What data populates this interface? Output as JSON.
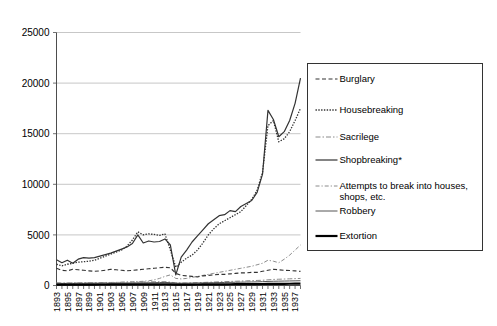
{
  "chart_data": {
    "type": "line",
    "title": "",
    "xlabel": "",
    "ylabel": "",
    "ylim": [
      0,
      25000
    ],
    "xlim": [
      1893,
      1938
    ],
    "grid": true,
    "legend_position": "right",
    "y_ticks": [
      0,
      5000,
      10000,
      15000,
      20000,
      25000
    ],
    "y_tick_labels": [
      "0",
      "5000",
      "10000",
      "15000",
      "20000",
      "25000"
    ],
    "x_tick_labels": [
      "1893",
      "1895",
      "1897",
      "1899",
      "1901",
      "1903",
      "1905",
      "1907",
      "1909",
      "1911",
      "1913",
      "1915",
      "1917",
      "1919",
      "1921",
      "1923",
      "1925",
      "1927",
      "1929",
      "1931",
      "1933",
      "1935",
      "1937"
    ],
    "x_all_years": [
      1893,
      1894,
      1895,
      1896,
      1897,
      1898,
      1899,
      1900,
      1901,
      1902,
      1903,
      1904,
      1905,
      1906,
      1907,
      1908,
      1909,
      1910,
      1911,
      1912,
      1913,
      1914,
      1915,
      1916,
      1917,
      1918,
      1919,
      1920,
      1921,
      1922,
      1923,
      1924,
      1925,
      1926,
      1927,
      1928,
      1929,
      1930,
      1931,
      1932,
      1933,
      1934,
      1935,
      1936,
      1937,
      1938
    ],
    "series": [
      {
        "name": "Burglary",
        "style": "dashed",
        "color": "#333333",
        "width": 1.1,
        "dasharray": "4,2.5",
        "values": [
          1700,
          1500,
          1450,
          1600,
          1550,
          1500,
          1450,
          1400,
          1450,
          1500,
          1600,
          1550,
          1500,
          1450,
          1500,
          1550,
          1600,
          1650,
          1700,
          1750,
          1800,
          1750,
          1200,
          1000,
          950,
          900,
          850,
          950,
          1000,
          1050,
          1100,
          1100,
          1150,
          1200,
          1250,
          1250,
          1300,
          1300,
          1400,
          1500,
          1600,
          1550,
          1500,
          1480,
          1450,
          1400
        ]
      },
      {
        "name": "Housebreaking",
        "style": "dotted",
        "color": "#333333",
        "width": 1.3,
        "dasharray": "1.4,1.4",
        "values": [
          2100,
          1950,
          2100,
          2200,
          2300,
          2350,
          2400,
          2500,
          2700,
          2900,
          3100,
          3300,
          3500,
          3900,
          4500,
          5300,
          5000,
          5100,
          5050,
          4950,
          5100,
          3500,
          1800,
          2300,
          2700,
          3000,
          3500,
          4200,
          5000,
          5600,
          6100,
          6400,
          6700,
          7000,
          7300,
          7900,
          8500,
          9400,
          11200,
          15800,
          16300,
          14200,
          14500,
          15200,
          16300,
          17500
        ]
      },
      {
        "name": "Sacrilege",
        "style": "dashdot-light",
        "color": "#8a8a8a",
        "width": 1.0,
        "dasharray": "5,2,1.5,2",
        "values": [
          260,
          250,
          250,
          260,
          270,
          270,
          280,
          280,
          290,
          300,
          300,
          310,
          320,
          330,
          340,
          350,
          360,
          360,
          370,
          370,
          380,
          330,
          260,
          250,
          250,
          260,
          280,
          300,
          320,
          340,
          360,
          380,
          400,
          420,
          440,
          460,
          480,
          500,
          520,
          560,
          600,
          620,
          640,
          660,
          680,
          700
        ]
      },
      {
        "name": "Shopbreaking*",
        "style": "solid",
        "color": "#333333",
        "width": 1.2,
        "dasharray": "",
        "values": [
          2550,
          2250,
          2500,
          2200,
          2600,
          2750,
          2700,
          2750,
          2900,
          3050,
          3200,
          3400,
          3600,
          3800,
          4150,
          5000,
          4200,
          4400,
          4300,
          4350,
          4600,
          4000,
          1050,
          2800,
          3500,
          4300,
          4900,
          5500,
          6100,
          6500,
          6900,
          7000,
          7400,
          7300,
          7800,
          8100,
          8400,
          9200,
          11000,
          17300,
          16400,
          14700,
          15200,
          16300,
          18000,
          20500
        ]
      },
      {
        "name": "Attempts to break into houses, shops, etc.",
        "style": "dashdot-light2",
        "color": "#8a8a8a",
        "width": 1.0,
        "dasharray": "4,2,1.2,2",
        "values": [
          230,
          225,
          230,
          235,
          240,
          245,
          250,
          255,
          265,
          280,
          290,
          300,
          320,
          340,
          360,
          380,
          420,
          460,
          560,
          700,
          900,
          1050,
          700,
          650,
          700,
          800,
          900,
          1000,
          1100,
          1200,
          1300,
          1400,
          1500,
          1600,
          1700,
          1800,
          1900,
          2050,
          2200,
          2500,
          2400,
          2250,
          2600,
          3000,
          3500,
          4000
        ]
      },
      {
        "name": "Robbery",
        "style": "solid-light",
        "color": "#555555",
        "width": 1.0,
        "dasharray": "",
        "values": [
          210,
          200,
          205,
          210,
          215,
          215,
          220,
          220,
          225,
          230,
          235,
          240,
          245,
          250,
          255,
          260,
          265,
          270,
          280,
          290,
          300,
          280,
          230,
          225,
          230,
          240,
          250,
          260,
          270,
          280,
          290,
          300,
          310,
          320,
          330,
          340,
          350,
          360,
          380,
          400,
          420,
          430,
          440,
          450,
          460,
          470
        ]
      },
      {
        "name": "Extortion",
        "style": "solid-thick",
        "color": "#000000",
        "width": 2.2,
        "dasharray": "",
        "values": [
          90,
          88,
          90,
          92,
          94,
          94,
          96,
          96,
          98,
          100,
          102,
          104,
          106,
          108,
          110,
          112,
          114,
          116,
          118,
          120,
          122,
          115,
          95,
          92,
          94,
          96,
          100,
          104,
          108,
          112,
          116,
          120,
          124,
          128,
          132,
          136,
          140,
          144,
          150,
          156,
          162,
          166,
          170,
          174,
          178,
          182
        ]
      }
    ]
  },
  "legend": {
    "items": [
      {
        "label": "Burglary"
      },
      {
        "label": "Housebreaking"
      },
      {
        "label": "Sacrilege"
      },
      {
        "label": "Shopbreaking*"
      },
      {
        "label": "Attempts to break into houses,",
        "label2": "shops, etc."
      },
      {
        "label": "Robbery"
      },
      {
        "label": "Extortion"
      }
    ]
  }
}
